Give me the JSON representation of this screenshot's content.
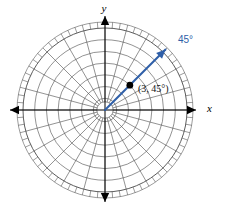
{
  "figure": {
    "kind": "polar-coordinate-plane",
    "width": 251,
    "height": 213,
    "background": "#ffffff"
  },
  "axes": {
    "x_label": "x",
    "y_label": "y",
    "axis_color": "#000000",
    "x_label_position": {
      "x": 207,
      "y": 112
    },
    "y_label_position": {
      "x": 104,
      "y": 12
    }
  },
  "annotations": {
    "ray_angle_label": "45°",
    "ray_angle_label_position": {
      "x": 178,
      "y": 43
    },
    "point_label": "(3, 45°)",
    "point_label_position": {
      "x": 138,
      "y": 92
    },
    "accent_color": "#2f5fa8",
    "point_color": "#000000"
  },
  "chart_data": {
    "type": "scatter",
    "plot_kind": "polar",
    "title": "",
    "xlabel": "x",
    "ylabel": "y",
    "center_px": {
      "x": 105,
      "y": 110
    },
    "outer_radius_px": 82,
    "grid": true,
    "legend": "none",
    "radial_gridlines": {
      "count": 7,
      "r_values": [
        1,
        2,
        3,
        4,
        5,
        6,
        7
      ],
      "inner_hub_r": 0.7,
      "rlim": [
        0,
        7
      ]
    },
    "angular_gridlines": {
      "spoke_count": 24,
      "spoke_step_deg": 15,
      "theta_values_deg": [
        0,
        15,
        30,
        45,
        60,
        75,
        90,
        105,
        120,
        135,
        150,
        165,
        180,
        195,
        210,
        225,
        240,
        255,
        270,
        285,
        300,
        315,
        330,
        345
      ]
    },
    "outer_ticks": {
      "count": 72,
      "step_deg": 5,
      "length_px": 6
    },
    "series": [
      {
        "name": "plotted point",
        "points": [
          {
            "label": "(3, 45°)",
            "r": 3,
            "theta_deg": 45
          }
        ]
      }
    ],
    "rays": [
      {
        "name": "terminal-ray",
        "label": "45°",
        "theta_deg": 45,
        "r_start": 0,
        "r_end": 7.3,
        "color": "#2f5fa8",
        "arrow": true
      }
    ]
  }
}
